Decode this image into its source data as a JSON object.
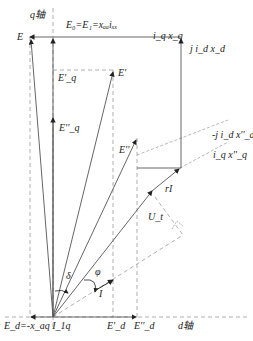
{
  "diagram": {
    "type": "phasor-diagram",
    "axes": {
      "q_axis_label": "q轴",
      "d_axis_label": "d轴"
    },
    "labels": {
      "E": "E",
      "Eq_top": "E₀=E₁=xₐₐiₓₓ",
      "Eq_top_main": "E",
      "iqxq": "i_q x_q",
      "jidxd": "j i_d x_d",
      "E_prime": "E'",
      "Eq_prime": "E'_q",
      "Eq_double": "E''_q",
      "E_double": "E''",
      "jidxd_double": "-j i_d x''_d",
      "iqxq_double": "i_q x''_q",
      "rI": "rI",
      "Ut": "U_t",
      "delta": "δ",
      "phi": "φ",
      "I": "I",
      "Ed": "E_d=-x_aq I_1q",
      "Ed_prime": "E'_d",
      "Ed_double": "E''_d"
    },
    "colors": {
      "line": "#555555",
      "dash": "#888888",
      "text": "#222222",
      "bg": "#ffffff"
    }
  }
}
